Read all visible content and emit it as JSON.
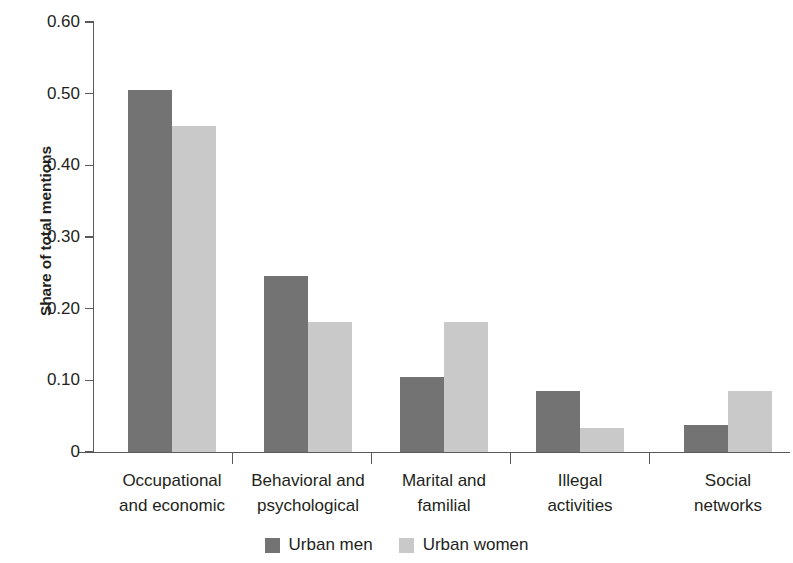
{
  "chart_data": {
    "type": "bar",
    "title": "",
    "subtitle": "",
    "xlabel": "",
    "ylabel": "Share of total mentions",
    "ylim": [
      0,
      0.6
    ],
    "ytick_values": [
      0,
      0.1,
      0.2,
      0.3,
      0.4,
      0.5,
      0.6
    ],
    "ytick_labels": [
      "0",
      "0.10",
      "0.20",
      "0.30",
      "0.40",
      "0.50",
      "0.60"
    ],
    "grid": false,
    "legend_position": "bottom-center",
    "categories": [
      "Occupational and economic",
      "Behavioral and psychological",
      "Marital and familial",
      "Illegal activities",
      "Social networks"
    ],
    "category_lines": [
      [
        "Occupational",
        "and economic"
      ],
      [
        "Behavioral and",
        "psychological"
      ],
      [
        "Marital and",
        "familial"
      ],
      [
        "Illegal",
        "activities"
      ],
      [
        "Social",
        "networks"
      ]
    ],
    "series": [
      {
        "name": "Urban men",
        "color": "#737373",
        "values": [
          0.505,
          0.245,
          0.105,
          0.085,
          0.037
        ]
      },
      {
        "name": "Urban women",
        "color": "#c9c9c9",
        "values": [
          0.455,
          0.182,
          0.182,
          0.033,
          0.085
        ]
      }
    ]
  },
  "legend": {
    "items": [
      {
        "label": "Urban men",
        "color": "#737373"
      },
      {
        "label": "Urban women",
        "color": "#c9c9c9"
      }
    ]
  },
  "axis": {
    "y_title": "Share of total mentions",
    "axis_color": "#58595b"
  }
}
